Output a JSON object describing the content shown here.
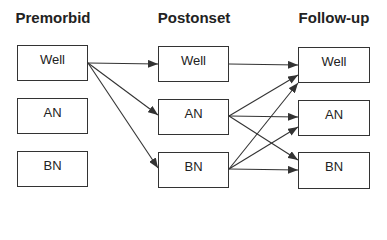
{
  "diagram": {
    "columns": [
      {
        "id": "premorbid",
        "title": "Premorbid",
        "nodes": [
          "Well",
          "AN",
          "BN"
        ]
      },
      {
        "id": "postonset",
        "title": "Postonset",
        "nodes": [
          "Well",
          "AN",
          "BN"
        ]
      },
      {
        "id": "followup",
        "title": "Follow-up",
        "nodes": [
          "Well",
          "AN",
          "BN"
        ]
      }
    ],
    "edges": [
      {
        "from": "premorbid.Well",
        "to": "postonset.Well"
      },
      {
        "from": "premorbid.Well",
        "to": "postonset.AN"
      },
      {
        "from": "premorbid.Well",
        "to": "postonset.BN"
      },
      {
        "from": "postonset.Well",
        "to": "followup.Well"
      },
      {
        "from": "postonset.AN",
        "to": "followup.Well"
      },
      {
        "from": "postonset.AN",
        "to": "followup.AN"
      },
      {
        "from": "postonset.AN",
        "to": "followup.BN"
      },
      {
        "from": "postonset.BN",
        "to": "followup.Well"
      },
      {
        "from": "postonset.BN",
        "to": "followup.AN"
      },
      {
        "from": "postonset.BN",
        "to": "followup.BN"
      }
    ],
    "colors": {
      "line": "#333333",
      "text": "#222222",
      "background": "#ffffff"
    }
  }
}
